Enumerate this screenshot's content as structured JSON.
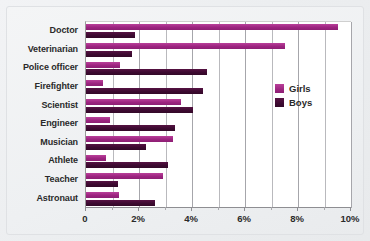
{
  "chart_data": {
    "type": "bar",
    "orientation": "horizontal",
    "title": "",
    "subtitle": "",
    "xlabel": "",
    "ylabel": "",
    "xlim": [
      0,
      10
    ],
    "ylim": null,
    "grid": true,
    "grid_axis": "x",
    "legend_position": "right-inside",
    "categories": [
      "Doctor",
      "Veterinarian",
      "Police officer",
      "Firefighter",
      "Scientist",
      "Engineer",
      "Musician",
      "Athlete",
      "Teacher",
      "Astronaut"
    ],
    "series": [
      {
        "name": "Girls",
        "color": "#9d2480",
        "values": [
          9.5,
          7.5,
          1.3,
          0.65,
          3.6,
          0.9,
          3.3,
          0.75,
          2.9,
          1.25
        ]
      },
      {
        "name": "Boys",
        "color": "#3d0a31",
        "values": [
          1.85,
          1.75,
          4.55,
          4.4,
          4.05,
          3.35,
          2.25,
          3.1,
          1.2,
          2.6
        ]
      }
    ],
    "xticks": [
      0,
      2,
      4,
      6,
      8,
      10
    ],
    "xtick_labels": [
      "0",
      "2%",
      "4%",
      "6%",
      "8%",
      "10%"
    ],
    "minor_xticks": [
      1,
      3,
      5,
      7,
      9
    ],
    "annotations": []
  },
  "legend": {
    "items": [
      {
        "label": "Girls",
        "color": "#9d2480"
      },
      {
        "label": "Boys",
        "color": "#3d0a31"
      }
    ]
  },
  "colors": {
    "girls": "#9d2480",
    "boys": "#3d0a31",
    "plot_background": "#ffffff",
    "figure_background": "#eef0f2",
    "gridline": "#b9b9bd",
    "axis": "#8e8e92",
    "text": "#2a2a2a"
  }
}
